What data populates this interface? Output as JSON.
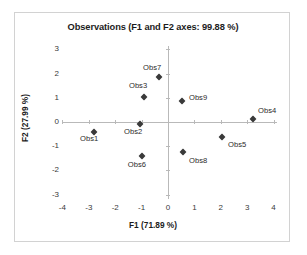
{
  "chart_data": {
    "type": "scatter",
    "title": "Observations (F1 and F2 axes: 99.88 %)",
    "xlabel": "F1 (71.89 %)",
    "ylabel": "F2 (27.99 %)",
    "xlim": [
      -4,
      4
    ],
    "ylim": [
      -3,
      3
    ],
    "xticks": [
      "-4",
      "-3",
      "-2",
      "-1",
      "0",
      "1",
      "2",
      "3",
      "4"
    ],
    "yticks": [
      "3",
      "2",
      "1",
      "0",
      "-1",
      "-2",
      "-3"
    ],
    "grid": false,
    "legend": "none",
    "marker": "diamond",
    "marker_color": "#3a3a3a",
    "points": [
      {
        "label": "Obs1",
        "x": -2.8,
        "y": -0.43,
        "label_dx": -14,
        "label_dy": 7
      },
      {
        "label": "Obs2",
        "x": -1.06,
        "y": -0.08,
        "label_dx": -16,
        "label_dy": 8
      },
      {
        "label": "Obs3",
        "x": -0.91,
        "y": 1.03,
        "label_dx": -15,
        "label_dy": -11
      },
      {
        "label": "Obs4",
        "x": 3.22,
        "y": 0.11,
        "label_dx": 5,
        "label_dy": -8
      },
      {
        "label": "Obs5",
        "x": 2.05,
        "y": -0.62,
        "label_dx": 6,
        "label_dy": 8
      },
      {
        "label": "Obs6",
        "x": -0.99,
        "y": -1.4,
        "label_dx": -14,
        "label_dy": 9
      },
      {
        "label": "Obs7",
        "x": -0.34,
        "y": 1.86,
        "label_dx": -16,
        "label_dy": -9
      },
      {
        "label": "Obs8",
        "x": 0.57,
        "y": -1.25,
        "label_dx": 6,
        "label_dy": 9
      },
      {
        "label": "Obs9",
        "x": 0.53,
        "y": 0.85,
        "label_dx": 7,
        "label_dy": -3
      }
    ]
  }
}
